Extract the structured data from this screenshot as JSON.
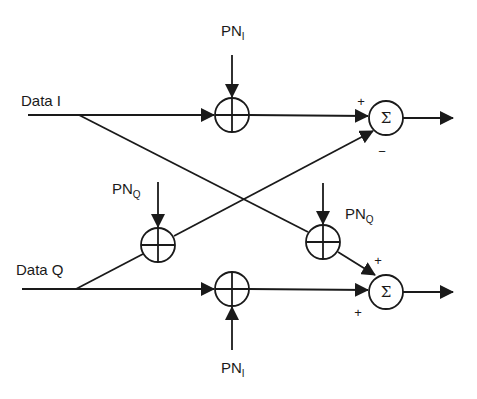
{
  "diagram": {
    "type": "block-diagram",
    "colors": {
      "stroke": "#1a1a1a",
      "background": "#ffffff"
    },
    "inputs": {
      "data_i": {
        "label": "Data I"
      },
      "data_q": {
        "label": "Data Q"
      }
    },
    "pn_labels": {
      "pn_i_top": {
        "main": "PN",
        "sub": "I"
      },
      "pn_q_left": {
        "main": "PN",
        "sub": "Q"
      },
      "pn_q_right": {
        "main": "PN",
        "sub": "Q"
      },
      "pn_i_bottom": {
        "main": "PN",
        "sub": "I"
      }
    },
    "mixers": [
      {
        "id": "mixer-top",
        "symbol": "XOR/multiplier",
        "inputs": [
          "Data I",
          "PN_I"
        ]
      },
      {
        "id": "mixer-q-cross",
        "symbol": "XOR/multiplier",
        "inputs": [
          "Data Q",
          "PN_Q"
        ]
      },
      {
        "id": "mixer-i-cross",
        "symbol": "XOR/multiplier",
        "inputs": [
          "Data I",
          "PN_Q"
        ]
      },
      {
        "id": "mixer-bottom",
        "symbol": "XOR/multiplier",
        "inputs": [
          "Data Q",
          "PN_I"
        ]
      }
    ],
    "summers": {
      "top": {
        "symbol": "Σ",
        "sign_upper": "+",
        "sign_lower": "−"
      },
      "bottom": {
        "symbol": "Σ",
        "sign_upper": "+",
        "sign_lower": "+"
      }
    }
  }
}
